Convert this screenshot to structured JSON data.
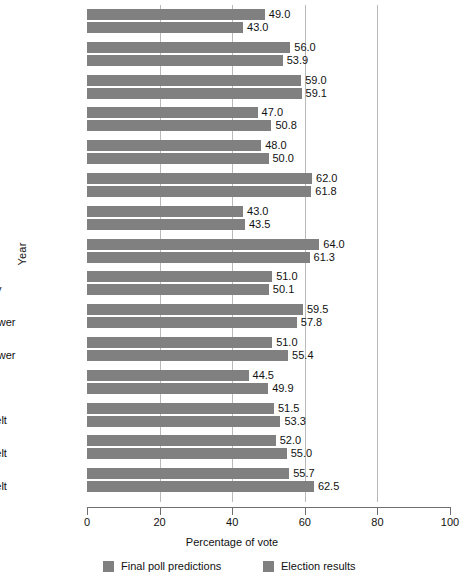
{
  "chart_data": {
    "type": "bar",
    "orientation": "horizontal",
    "title": "",
    "xlabel": "Percentage of vote",
    "ylabel": "Year",
    "xlim": [
      0,
      100
    ],
    "xticks": [
      0,
      20,
      40,
      60,
      80,
      100
    ],
    "gridlines": [
      20,
      40,
      60,
      80
    ],
    "grid": true,
    "legend_position": "bottom",
    "bar_color": "#808080",
    "categories": [
      "1992\nClinton",
      "1988\nBush",
      "1984\nReagan",
      "1980\nReagan",
      "1976\nCarter",
      "1972\nNixon",
      "1968\nNixon",
      "1964\nJohnson",
      "1960\nKennedy",
      "1956\nEisenhower",
      "1952\nEisenhower",
      "1948\nTruman",
      "1944\nRoosevelt",
      "1940\nRoosevelt",
      "1936\nRoosevelt"
    ],
    "series": [
      {
        "name": "Final poll predictions",
        "values": [
          49.0,
          56.0,
          59.0,
          47.0,
          48.0,
          62.0,
          43.0,
          64.0,
          51.0,
          59.5,
          51.0,
          44.5,
          51.5,
          52.0,
          55.7
        ]
      },
      {
        "name": "Election results",
        "values": [
          43.0,
          53.9,
          59.1,
          50.8,
          50.0,
          61.8,
          43.5,
          61.3,
          50.1,
          57.8,
          55.4,
          49.9,
          53.3,
          55.0,
          62.5
        ]
      }
    ]
  },
  "groups": [
    {
      "year": "1992",
      "name": "Clinton",
      "poll": "49.0",
      "result": "43.0",
      "poll_v": 49.0,
      "result_v": 43.0
    },
    {
      "year": "1988",
      "name": "Bush",
      "poll": "56.0",
      "result": "53.9",
      "poll_v": 56.0,
      "result_v": 53.9
    },
    {
      "year": "1984",
      "name": "Reagan",
      "poll": "59.0",
      "result": "59.1",
      "poll_v": 59.0,
      "result_v": 59.1
    },
    {
      "year": "1980",
      "name": "Reagan",
      "poll": "47.0",
      "result": "50.8",
      "poll_v": 47.0,
      "result_v": 50.8
    },
    {
      "year": "1976",
      "name": "Carter",
      "poll": "48.0",
      "result": "50.0",
      "poll_v": 48.0,
      "result_v": 50.0
    },
    {
      "year": "1972",
      "name": "Nixon",
      "poll": "62.0",
      "result": "61.8",
      "poll_v": 62.0,
      "result_v": 61.8
    },
    {
      "year": "1968",
      "name": "Nixon",
      "poll": "43.0",
      "result": "43.5",
      "poll_v": 43.0,
      "result_v": 43.5
    },
    {
      "year": "1964",
      "name": "Johnson",
      "poll": "64.0",
      "result": "61.3",
      "poll_v": 64.0,
      "result_v": 61.3
    },
    {
      "year": "1960",
      "name": "Kennedy",
      "poll": "51.0",
      "result": "50.1",
      "poll_v": 51.0,
      "result_v": 50.1
    },
    {
      "year": "1956",
      "name": "Eisenhower",
      "poll": "59.5",
      "result": "57.8",
      "poll_v": 59.5,
      "result_v": 57.8
    },
    {
      "year": "1952",
      "name": "Eisenhower",
      "poll": "51.0",
      "result": "55.4",
      "poll_v": 51.0,
      "result_v": 55.4
    },
    {
      "year": "1948",
      "name": "Truman",
      "poll": "44.5",
      "result": "49.9",
      "poll_v": 44.5,
      "result_v": 49.9
    },
    {
      "year": "1944",
      "name": "Roosevelt",
      "poll": "51.5",
      "result": "53.3",
      "poll_v": 51.5,
      "result_v": 53.3
    },
    {
      "year": "1940",
      "name": "Roosevelt",
      "poll": "52.0",
      "result": "55.0",
      "poll_v": 52.0,
      "result_v": 55.0
    },
    {
      "year": "1936",
      "name": "Roosevelt",
      "poll": "55.7",
      "result": "62.5",
      "poll_v": 55.7,
      "result_v": 62.5
    }
  ],
  "axes": {
    "y_title": "Year",
    "x_title": "Percentage of vote",
    "x_tick_labels": [
      "0",
      "20",
      "40",
      "60",
      "80",
      "100"
    ]
  },
  "legend": {
    "items": [
      {
        "label": "Final poll predictions",
        "color": "#808080"
      },
      {
        "label": "Election results",
        "color": "#808080"
      }
    ]
  }
}
